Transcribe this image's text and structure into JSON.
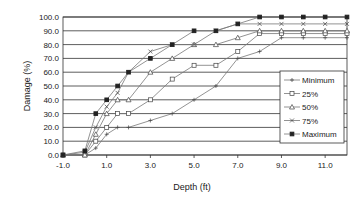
{
  "chart_data": {
    "type": "line",
    "title": "",
    "xlabel": "Depth (ft)",
    "ylabel": "Damage (%)",
    "xlim": [
      -1.0,
      12.0
    ],
    "ylim": [
      0.0,
      100.0
    ],
    "x_ticks": [
      "-1.0",
      "1.0",
      "3.0",
      "5.0",
      "7.0",
      "9.0",
      "11.0"
    ],
    "y_ticks": [
      "0.0",
      "10.0",
      "20.0",
      "30.0",
      "40.0",
      "50.0",
      "60.0",
      "70.0",
      "80.0",
      "90.0",
      "100.0"
    ],
    "grid": "horizontal",
    "legend_position": "right-inside",
    "x": [
      -1,
      0,
      0.5,
      1,
      1.5,
      2,
      3,
      4,
      5,
      6,
      7,
      8,
      9,
      10,
      11,
      12
    ],
    "series": [
      {
        "name": "Minimum",
        "marker": "plus",
        "values": [
          0,
          0,
          5,
          15,
          20,
          20,
          25,
          30,
          40,
          50,
          70,
          75,
          85,
          85,
          85,
          85
        ]
      },
      {
        "name": "25%",
        "marker": "square",
        "values": [
          0,
          0,
          10,
          20,
          30,
          30,
          40,
          55,
          65,
          65,
          75,
          88,
          88,
          88,
          88,
          88
        ]
      },
      {
        "name": "50%",
        "marker": "triangle",
        "values": [
          0,
          0,
          15,
          30,
          40,
          40,
          60,
          70,
          80,
          80,
          85,
          90,
          90,
          90,
          90,
          90
        ]
      },
      {
        "name": "75%",
        "marker": "x",
        "values": [
          0,
          2,
          20,
          35,
          45,
          60,
          75,
          80,
          80,
          90,
          95,
          95,
          95,
          95,
          95,
          95
        ]
      },
      {
        "name": "Maximum",
        "marker": "filled-square",
        "values": [
          0,
          3,
          30,
          40,
          50,
          60,
          70,
          80,
          90,
          90,
          95,
          100,
          100,
          100,
          100,
          100
        ]
      }
    ]
  },
  "legend": {
    "items": [
      "Minimum",
      "25%",
      "50%",
      "75%",
      "Maximum"
    ]
  },
  "axes": {
    "xlabel": "Depth (ft)",
    "ylabel": "Damage (%)"
  }
}
